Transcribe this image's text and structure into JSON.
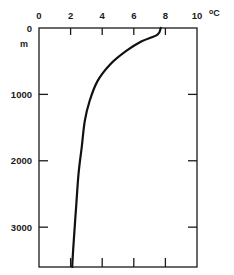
{
  "chart_data": {
    "type": "line",
    "title": "",
    "xlabel": "°C",
    "ylabel": "m",
    "x_axis_position": "top",
    "y_axis_inverted": true,
    "xlim": [
      0,
      10
    ],
    "ylim": [
      0,
      3600
    ],
    "x_ticks": [
      "0",
      "2",
      "4",
      "6",
      "8",
      "10"
    ],
    "y_ticks": [
      "0",
      "1000",
      "2000",
      "3000"
    ],
    "grid": false,
    "legend": null,
    "series": [
      {
        "name": "Temperature profile",
        "points": [
          {
            "temp": 7.7,
            "depth": 0
          },
          {
            "temp": 7.5,
            "depth": 100
          },
          {
            "temp": 6.5,
            "depth": 200
          },
          {
            "temp": 5.5,
            "depth": 350
          },
          {
            "temp": 4.5,
            "depth": 550
          },
          {
            "temp": 3.7,
            "depth": 800
          },
          {
            "temp": 3.2,
            "depth": 1100
          },
          {
            "temp": 2.9,
            "depth": 1400
          },
          {
            "temp": 2.7,
            "depth": 1800
          },
          {
            "temp": 2.5,
            "depth": 2200
          },
          {
            "temp": 2.35,
            "depth": 2700
          },
          {
            "temp": 2.2,
            "depth": 3200
          },
          {
            "temp": 2.1,
            "depth": 3600
          }
        ]
      }
    ]
  },
  "axis": {
    "x_unit_label": "°C",
    "y_unit_label": "m"
  }
}
